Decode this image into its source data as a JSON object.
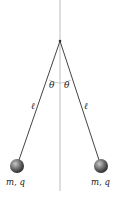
{
  "diagram": {
    "type": "charged-pendulums",
    "angle_labels": [
      "θ",
      "θ"
    ],
    "length_labels": [
      "ℓ",
      "ℓ"
    ],
    "mass_labels": [
      "m, q",
      "m, q"
    ],
    "colors": {
      "string": "#444444",
      "vertical_line": "#bbbbbb",
      "ball_light": "#bdbdbd",
      "ball_dark": "#3a3a3a",
      "text": "#222222"
    }
  }
}
